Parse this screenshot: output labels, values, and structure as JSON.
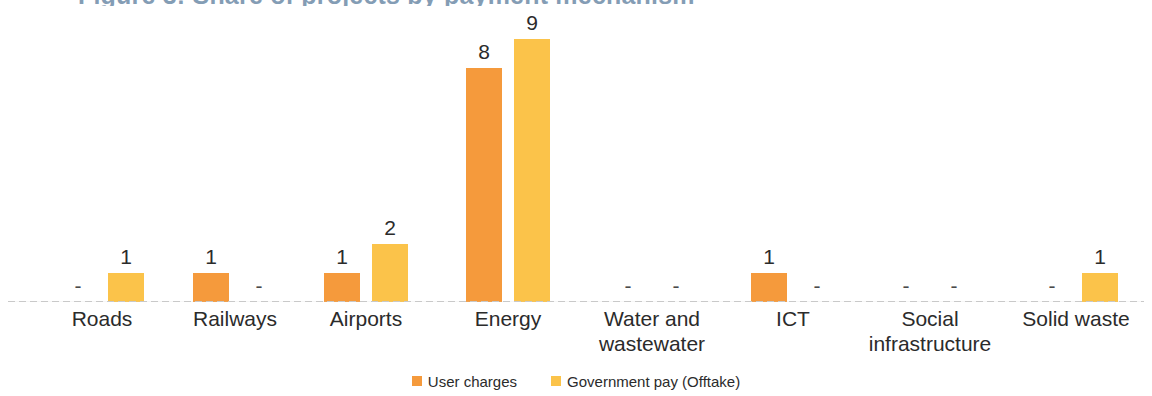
{
  "title_partial": "Figure 3: Share of projects by payment mechanism",
  "chart_data": {
    "type": "bar",
    "title": "",
    "xlabel": "",
    "ylabel": "",
    "grid": false,
    "legend_position": "bottom-center",
    "ylim": [
      0,
      10
    ],
    "categories": [
      "Roads",
      "Railways",
      "Airports",
      "Energy",
      "Water and\nwastewater",
      "ICT",
      "Social\ninfrastructure",
      "Solid waste"
    ],
    "series": [
      {
        "name": "User charges",
        "color": "#F59A3C",
        "values": [
          null,
          1,
          1,
          8,
          null,
          1,
          null,
          null
        ],
        "labels": [
          "-",
          "1",
          "1",
          "8",
          "-",
          "1",
          "-",
          "-"
        ]
      },
      {
        "name": "Government pay (Offtake)",
        "color": "#FBC34A",
        "values": [
          1,
          null,
          2,
          9,
          null,
          null,
          null,
          1
        ],
        "labels": [
          "1",
          "-",
          "2",
          "9",
          "-",
          "-",
          "-",
          "1"
        ]
      }
    ],
    "null_label": "-"
  },
  "colors": {
    "user_charges": "#F59A3C",
    "government_pay": "#FBC34A",
    "axis_line": "#c9c9c9",
    "text": "#2b2b2b",
    "background": "#ffffff"
  }
}
